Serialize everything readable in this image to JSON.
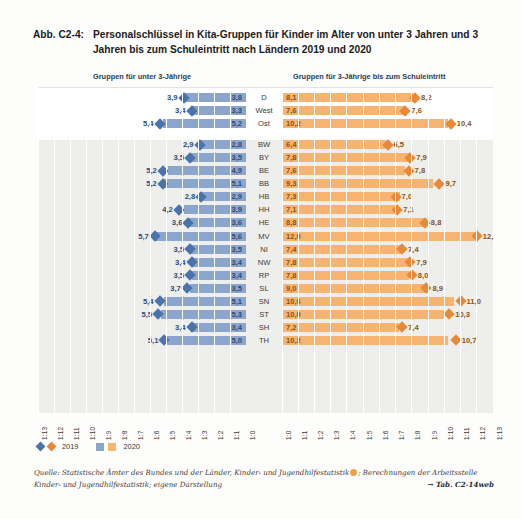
{
  "figure": {
    "number": "Abb. C2-4:",
    "title": "Personalschlüssel in Kita-Gruppen für Kinder im Alter von unter 3 Jahren und 3 Jahren bis zum Schuleintritt nach Ländern 2019 und 2020"
  },
  "headers": {
    "left": "Gruppen für unter 3-Jährige",
    "right": "Gruppen für 3-Jährige bis zum Schuleintritt"
  },
  "legend": {
    "item_2019": "2019",
    "item_2020": "2020"
  },
  "source": {
    "line1_pre": "Quelle: Statistische Ämter des Bundes und der Länder, Kinder- und Jugendhilfestatistik",
    "line1_post": "; Berechnungen der Arbeitsstelle",
    "line2": "Kinder- und Jugendhilfestatistik; eigene Darstellung",
    "tab_ref": "→ Tab. C2-14web"
  },
  "axes": {
    "left_ticks": [
      "1:13",
      "1:12",
      "1:11",
      "1:10",
      "1:9",
      "1:8",
      "1:7",
      "1:6",
      "1:5",
      "1:4",
      "1:3",
      "1:2",
      "1:1",
      "1:0"
    ],
    "right_ticks": [
      "1:0",
      "1:1",
      "1:2",
      "1:3",
      "1:4",
      "1:5",
      "1:6",
      "1:7",
      "1:8",
      "1:9",
      "1:10",
      "1:11",
      "1:12",
      "1:13"
    ],
    "max": 13
  },
  "colors": {
    "bar_2020_u3": "#8aa6cf",
    "marker_2019_u3": "#4a72ab",
    "bar_2020_ue3": "#f7b470",
    "marker_2019_ue3": "#e8893a",
    "band_upper": "#ffffff",
    "band_lower": "#eeeeec"
  },
  "chart_data": {
    "type": "bar",
    "title": "Personalschlüssel in Kita-Gruppen für Kinder im Alter von unter 3 Jahren und 3 Jahren bis zum Schuleintritt nach Ländern 2019 und 2020",
    "xlabel": "",
    "ylabel": "",
    "xlim": [
      0,
      13
    ],
    "grid": true,
    "legend_position": "bottom-left",
    "panels": [
      {
        "name": "Gruppen für unter 3-Jährige",
        "series": [
          {
            "name": "2019",
            "marker": "diamond"
          },
          {
            "name": "2020",
            "marker": "bar"
          }
        ]
      },
      {
        "name": "Gruppen für 3-Jährige bis zum Schuleintritt",
        "series": [
          {
            "name": "2019",
            "marker": "diamond"
          },
          {
            "name": "2020",
            "marker": "bar"
          }
        ]
      }
    ],
    "categories": [
      "D",
      "West",
      "Ost",
      "BW",
      "BY",
      "BE",
      "BB",
      "HB",
      "HH",
      "HE",
      "MV",
      "NI",
      "NW",
      "RP",
      "SL",
      "SN",
      "ST",
      "SH",
      "TH"
    ],
    "rows": [
      {
        "state": "D",
        "group": "national",
        "u3_2019": 3.9,
        "u3_2020": 3.8,
        "ue3_2019": 8.2,
        "ue3_2020": 8.1
      },
      {
        "state": "West",
        "group": "national",
        "u3_2019": 3.4,
        "u3_2020": 3.3,
        "ue3_2019": 7.6,
        "ue3_2020": 7.6
      },
      {
        "state": "Ost",
        "group": "national",
        "u3_2019": 5.4,
        "u3_2020": 5.2,
        "ue3_2019": 10.4,
        "ue3_2020": 10.2
      },
      {
        "state": "BW",
        "group": "land",
        "u3_2019": 2.9,
        "u3_2020": 2.8,
        "ue3_2019": 6.5,
        "ue3_2020": 6.4
      },
      {
        "state": "BY",
        "group": "land",
        "u3_2019": 3.5,
        "u3_2020": 3.5,
        "ue3_2019": 7.9,
        "ue3_2020": 7.8
      },
      {
        "state": "BE",
        "group": "land",
        "u3_2019": 5.2,
        "u3_2020": 4.9,
        "ue3_2019": 7.8,
        "ue3_2020": 7.6
      },
      {
        "state": "BB",
        "group": "land",
        "u3_2019": 5.2,
        "u3_2020": 5.1,
        "ue3_2019": 9.7,
        "ue3_2020": 9.3
      },
      {
        "state": "HB",
        "group": "land",
        "u3_2019": 2.8,
        "u3_2020": 2.9,
        "ue3_2019": 7.0,
        "ue3_2020": 7.3
      },
      {
        "state": "HH",
        "group": "land",
        "u3_2019": 4.2,
        "u3_2020": 3.9,
        "ue3_2019": 7.1,
        "ue3_2020": 7.1
      },
      {
        "state": "HE",
        "group": "land",
        "u3_2019": 3.6,
        "u3_2020": 3.6,
        "ue3_2019": 8.8,
        "ue3_2020": 8.8
      },
      {
        "state": "MV",
        "group": "land",
        "u3_2019": 5.7,
        "u3_2020": 5.6,
        "ue3_2019": 12.0,
        "ue3_2020": 12.0
      },
      {
        "state": "NI",
        "group": "land",
        "u3_2019": 3.5,
        "u3_2020": 3.5,
        "ue3_2019": 7.4,
        "ue3_2020": 7.4
      },
      {
        "state": "NW",
        "group": "land",
        "u3_2019": 3.4,
        "u3_2020": 3.4,
        "ue3_2019": 7.9,
        "ue3_2020": 7.8
      },
      {
        "state": "RP",
        "group": "land",
        "u3_2019": 3.5,
        "u3_2020": 3.4,
        "ue3_2019": 8.0,
        "ue3_2020": 7.8
      },
      {
        "state": "SL",
        "group": "land",
        "u3_2019": 3.7,
        "u3_2020": 3.5,
        "ue3_2019": 8.9,
        "ue3_2020": 9.0
      },
      {
        "state": "SN",
        "group": "land",
        "u3_2019": 5.4,
        "u3_2020": 5.1,
        "ue3_2019": 11.0,
        "ue3_2020": 10.6
      },
      {
        "state": "ST",
        "group": "land",
        "u3_2019": 5.5,
        "u3_2020": 5.3,
        "ue3_2019": 10.3,
        "ue3_2020": 10.0
      },
      {
        "state": "SH",
        "group": "land",
        "u3_2019": 3.4,
        "u3_2020": 3.4,
        "ue3_2019": 7.4,
        "ue3_2020": 7.2
      },
      {
        "state": "TH",
        "group": "land",
        "u3_2019": 5.1,
        "u3_2020": 5.0,
        "ue3_2019": 10.7,
        "ue3_2020": 10.2
      }
    ]
  }
}
